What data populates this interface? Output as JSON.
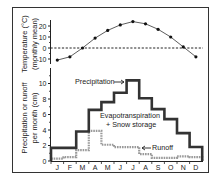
{
  "chart_data": [
    {
      "type": "line",
      "title": "",
      "xlabel": "",
      "ylabel": "Temperature (°C)",
      "ylabel2": "(monthly mean)",
      "categories": [
        "J",
        "F",
        "M",
        "A",
        "M",
        "J",
        "J",
        "A",
        "S",
        "O",
        "N",
        "D"
      ],
      "values": [
        -11,
        -8,
        0,
        9,
        16,
        21,
        24,
        22,
        17,
        10,
        1,
        -8
      ],
      "yticks": [
        20,
        10,
        0,
        -10
      ],
      "ylim": [
        -14,
        26
      ],
      "reference_line": {
        "y": 0,
        "style": "dashed"
      },
      "grid": false
    },
    {
      "type": "line",
      "step": true,
      "title": "",
      "xlabel": "",
      "ylabel": "Precipitation or runoff",
      "ylabel2": "per month (cm)",
      "categories": [
        "J",
        "F",
        "M",
        "A",
        "M",
        "J",
        "J",
        "A",
        "S",
        "O",
        "N",
        "D"
      ],
      "series": [
        {
          "name": "Precipitation",
          "style": "solid-thick",
          "color": "#333333",
          "values": [
            1.7,
            1.7,
            3.8,
            6.6,
            7.6,
            8.8,
            10.4,
            8.1,
            6.7,
            5.4,
            3.6,
            1.8
          ]
        },
        {
          "name": "Runoff",
          "style": "dotted-thick",
          "color": "#999999",
          "values": [
            0.3,
            0.5,
            1.4,
            3.9,
            2.1,
            1.8,
            1.8,
            0.9,
            0.4,
            0.4,
            0.6,
            0.5
          ]
        }
      ],
      "annotations": [
        "Precipitation",
        "Evapotranspiration",
        "+ Snow storage",
        "Runoff"
      ],
      "yticks": [
        0,
        2,
        4,
        6,
        8,
        10
      ],
      "ylim": [
        0,
        11
      ],
      "grid": false
    }
  ],
  "labels": {
    "temp_ylabel": "Temperature (°C)",
    "temp_ylabel2": "(monthly mean)",
    "precip_ylabel": "Precipitation or runoff",
    "precip_ylabel2": "per month (cm)",
    "ann_precip": "Precipitation",
    "ann_evap": "Evapotranspiration",
    "ann_snow": "+ Snow storage",
    "ann_runoff": "Runoff"
  }
}
